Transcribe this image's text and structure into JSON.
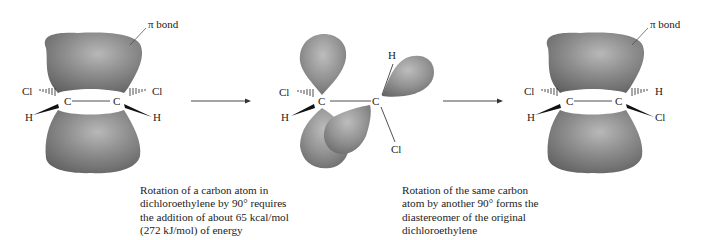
{
  "diagram": {
    "panels": [
      {
        "id": "planar-left",
        "pi_label": "π bond",
        "atoms": {
          "c1": "C",
          "c2": "C",
          "tl": "Cl",
          "bl": "H",
          "tr": "Cl",
          "br": "H"
        }
      },
      {
        "id": "twisted-middle",
        "atoms": {
          "c1": "C",
          "c2": "C",
          "tl": "Cl",
          "bl": "H",
          "top_right": "H",
          "bottom_right": "Cl"
        }
      },
      {
        "id": "planar-right",
        "pi_label": "π bond",
        "atoms": {
          "c1": "C",
          "c2": "C",
          "tl": "Cl",
          "bl": "H",
          "tr": "H",
          "br": "Cl"
        }
      }
    ],
    "arrows": [
      {
        "from": "planar-left",
        "to": "twisted-middle"
      },
      {
        "from": "twisted-middle",
        "to": "planar-right"
      }
    ],
    "captions": [
      {
        "lines": [
          "Rotation of a carbon atom in",
          "dichloroethylene by 90° requires",
          "the addition of about 65 kcal/mol",
          "(272 kJ/mol) of energy"
        ]
      },
      {
        "lines": [
          "Rotation of the same carbon",
          "atom by another 90° forms the",
          "diastereomer of the original",
          "dichloroethylene"
        ]
      }
    ]
  }
}
